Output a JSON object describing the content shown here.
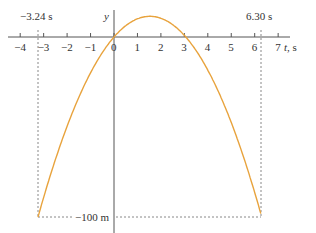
{
  "chart_data": {
    "type": "line",
    "title": "",
    "xlabel": "t, s",
    "ylabel": "y",
    "x_ticks": [
      -4,
      -3,
      -2,
      -1,
      0,
      1,
      2,
      3,
      4,
      5,
      6,
      7
    ],
    "xlim": [
      -4,
      7.5
    ],
    "ylim": [
      -100,
      12
    ],
    "grid": false,
    "series": [
      {
        "name": "y(t) = 15t - 4.9t^2",
        "color": "#E8A33D",
        "x": [
          -3.24,
          -2,
          -1,
          0,
          1,
          1.53,
          2,
          3,
          3.06,
          4,
          5,
          6,
          6.3
        ],
        "y": [
          -100,
          -49.6,
          -19.9,
          0,
          10.1,
          11.5,
          10.4,
          0.9,
          0,
          -18.4,
          -47.5,
          -86.4,
          -100
        ]
      }
    ],
    "annotations": [
      {
        "text": "−3.24 s",
        "x": -3.24,
        "type": "vertical-dashed"
      },
      {
        "text": "6.30 s",
        "x": 6.3,
        "type": "vertical-dashed"
      },
      {
        "text": "−100 m",
        "y": -100,
        "type": "horizontal-dashed"
      }
    ]
  },
  "labels": {
    "y_axis": "y",
    "t_axis": "t, s",
    "left_time": "−3.24 s",
    "right_time": "6.30 s",
    "bottom_height": "−100 m",
    "ticks": [
      "−4",
      "−3",
      "−2",
      "−1",
      "0",
      "1",
      "2",
      "3",
      "4",
      "5",
      "6",
      "7"
    ]
  },
  "colors": {
    "curve": "#E8A33D",
    "axis": "#555555",
    "dashed": "#888888"
  }
}
